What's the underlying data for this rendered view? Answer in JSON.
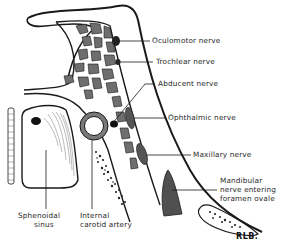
{
  "figure": {
    "labels": {
      "oculomotor": "Oculomotor nerve",
      "trochlear": "Trochlear nerve",
      "abducent": "Abducent nerve",
      "ophthalmic": "Ophthalmic nerve",
      "maxillary": "Maxillary nerve",
      "mandibular_1": "Mandibular",
      "mandibular_2": "nerve entering",
      "mandibular_3": "foramen ovale",
      "sphenoidal_1": "Sphenoidal",
      "sphenoidal_2": "sinus",
      "carotid_1": "Internal",
      "carotid_2": "carotid artery"
    },
    "signature": "RLB."
  },
  "colors": {
    "line": "#1a1a1a",
    "nerve_fill": "#555555",
    "venous_fill": "#6e6e6e",
    "background": "#ffffff"
  }
}
